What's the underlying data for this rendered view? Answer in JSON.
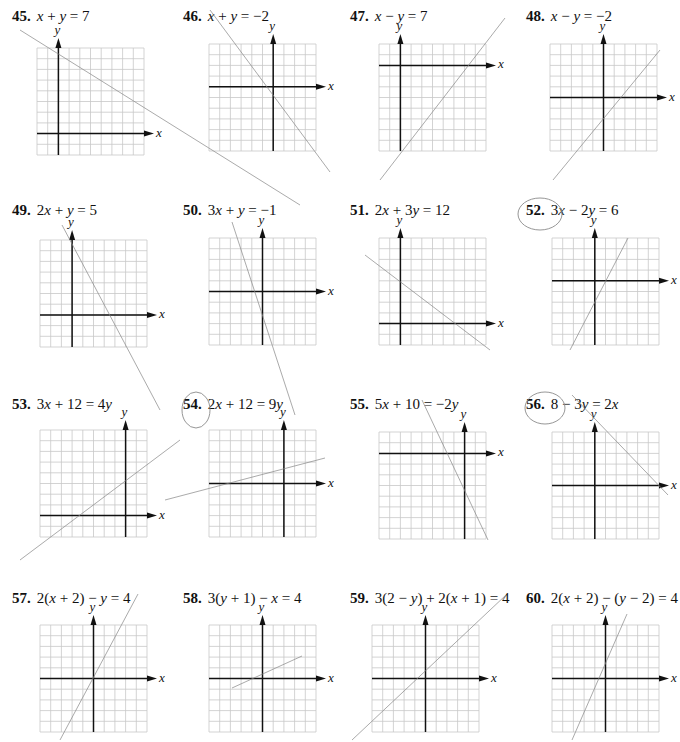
{
  "page": {
    "type": "textbook exercise page - graphing linear equations",
    "grid": {
      "cells": 10,
      "cell_px": 10.7,
      "line_color": "#c8c8c8",
      "axis_color": "#111111",
      "pencil_color": "#8a8a8a"
    }
  },
  "problems": [
    {
      "num": "45.",
      "eq_html": "<i>x</i> + <i>y</i> = 7",
      "eq": "x + y = 7",
      "x": 12,
      "y": 8,
      "gx": 37,
      "gy": 48,
      "ox": 2,
      "oy": 8
    },
    {
      "num": "46.",
      "eq_html": "<i>x</i> + <i>y</i> = −2",
      "eq": "x + y = −2",
      "x": 183,
      "y": 8,
      "gx": 209,
      "gy": 44,
      "ox": 6,
      "oy": 4
    },
    {
      "num": "47.",
      "eq_html": "<i>x</i> − <i>y</i> = 7",
      "eq": "x − y = 7",
      "x": 350,
      "y": 8,
      "gx": 379,
      "gy": 44,
      "ox": 2,
      "oy": 2
    },
    {
      "num": "48.",
      "eq_html": "<i>x</i> − <i>y</i> = −2",
      "eq": "x − y = −2",
      "x": 526,
      "y": 8,
      "gx": 550,
      "gy": 44,
      "ox": 5,
      "oy": 5
    },
    {
      "num": "49.",
      "eq_html": "2<i>x</i> + <i>y</i> = 5",
      "eq": "2x + y = 5",
      "x": 12,
      "y": 202,
      "gx": 40,
      "gy": 240,
      "ox": 3,
      "oy": 7
    },
    {
      "num": "50.",
      "eq_html": "3<i>x</i> + <i>y</i> = −1",
      "eq": "3x + y = −1",
      "x": 183,
      "y": 202,
      "gx": 209,
      "gy": 238,
      "ox": 5,
      "oy": 5
    },
    {
      "num": "51.",
      "eq_html": "2<i>x</i> + 3<i>y</i> = 12",
      "eq": "2x + 3y = 12",
      "x": 350,
      "y": 202,
      "gx": 379,
      "gy": 238,
      "ox": 2,
      "oy": 8
    },
    {
      "num": "52.",
      "eq_html": "3<i>x</i> − 2<i>y</i> = 6",
      "eq": "3x − 2y = 6",
      "x": 526,
      "y": 202,
      "gx": 552,
      "gy": 238,
      "ox": 4,
      "oy": 4
    },
    {
      "num": "53.",
      "eq_html": "3<i>x</i> + 12 = 4<i>y</i>",
      "eq": "3x + 12 = 4y",
      "x": 12,
      "y": 396,
      "gx": 40,
      "gy": 430,
      "ox": 8,
      "oy": 8
    },
    {
      "num": "54.",
      "eq_html": "2<i>x</i> + 12 = 9<i>y</i>",
      "eq": "2x + 12 = 9y",
      "x": 183,
      "y": 396,
      "gx": 209,
      "gy": 430,
      "ox": 7,
      "oy": 5
    },
    {
      "num": "55.",
      "eq_html": "5<i>x</i> + 10 = −2<i>y</i>",
      "eq": "5x + 10 = −2y",
      "x": 350,
      "y": 396,
      "gx": 379,
      "gy": 432,
      "ox": 8,
      "oy": 2
    },
    {
      "num": "56.",
      "eq_html": "8 − 3<i>y</i> = 2<i>x</i>",
      "eq": "8 − 3y = 2x",
      "x": 526,
      "y": 396,
      "gx": 552,
      "gy": 432,
      "ox": 4,
      "oy": 5
    },
    {
      "num": "57.",
      "eq_html": "2(<i>x</i> + 2) − <i>y</i> = 4",
      "eq": "2(x + 2) − y = 4",
      "x": 12,
      "y": 590,
      "gx": 40,
      "gy": 625,
      "ox": 5,
      "oy": 5
    },
    {
      "num": "58.",
      "eq_html": "3(<i>y</i> + 1) − <i>x</i> = 4",
      "eq": "3(y + 1) − x = 4",
      "x": 183,
      "y": 590,
      "gx": 209,
      "gy": 625,
      "ox": 5,
      "oy": 5
    },
    {
      "num": "59.",
      "eq_html": "3(2 − <i>y</i>) + 2(<i>x</i> + 1) = 4",
      "eq": "3(2 − y) + 2(x + 1) = 4",
      "x": 350,
      "y": 590,
      "gx": 372,
      "gy": 625,
      "ox": 5,
      "oy": 5
    },
    {
      "num": "60.",
      "eq_html": "2(<i>x</i> + 2) − (<i>y</i> − 2) = 4",
      "eq": "2(x + 2) − (y − 2) = 4",
      "x": 526,
      "y": 590,
      "gx": 552,
      "gy": 625,
      "ox": 5,
      "oy": 5
    }
  ],
  "axis_labels": {
    "x": "x",
    "y": "y"
  },
  "pencil_lines": [
    {
      "x1": 20,
      "y1": 30,
      "x2": 300,
      "y2": 205
    },
    {
      "x1": 210,
      "y1": 10,
      "x2": 330,
      "y2": 172
    },
    {
      "x1": 380,
      "y1": 180,
      "x2": 505,
      "y2": 18
    },
    {
      "x1": 553,
      "y1": 180,
      "x2": 660,
      "y2": 50
    },
    {
      "x1": 62,
      "y1": 225,
      "x2": 160,
      "y2": 410
    },
    {
      "x1": 232,
      "y1": 222,
      "x2": 295,
      "y2": 415
    },
    {
      "x1": 365,
      "y1": 255,
      "x2": 490,
      "y2": 350
    },
    {
      "x1": 570,
      "y1": 350,
      "x2": 628,
      "y2": 238
    },
    {
      "x1": 20,
      "y1": 560,
      "x2": 180,
      "y2": 440
    },
    {
      "x1": 165,
      "y1": 500,
      "x2": 325,
      "y2": 458
    },
    {
      "x1": 422,
      "y1": 400,
      "x2": 488,
      "y2": 540
    },
    {
      "x1": 572,
      "y1": 395,
      "x2": 668,
      "y2": 495
    },
    {
      "x1": 60,
      "y1": 740,
      "x2": 138,
      "y2": 594
    },
    {
      "x1": 232,
      "y1": 688,
      "x2": 302,
      "y2": 656
    },
    {
      "x1": 352,
      "y1": 740,
      "x2": 506,
      "y2": 595
    },
    {
      "x1": 572,
      "y1": 740,
      "x2": 627,
      "y2": 614
    }
  ]
}
